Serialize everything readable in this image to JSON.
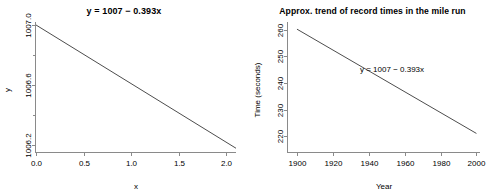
{
  "figure": {
    "background": "#ffffff",
    "line_color": "#4d4d4d",
    "axis_color": "#8a8a8a",
    "panel_count": 2
  },
  "chart_data": [
    {
      "type": "line",
      "panel": "left",
      "title": "y = 1007 − 0.393x",
      "xlabel": "x",
      "ylabel": "y",
      "xlim": [
        0.0,
        2.1
      ],
      "ylim": [
        1006.15,
        1007.02
      ],
      "xticks": [
        0.0,
        0.5,
        1.0,
        1.5,
        2.0
      ],
      "xticklabels": [
        "0.0",
        "0.5",
        "1.0",
        "1.5",
        "2.0"
      ],
      "yticks": [
        1006.2,
        1006.6,
        1007.0
      ],
      "yticklabels": [
        "1006.2",
        "1006.6",
        "1007.0"
      ],
      "yminorticks": [
        1006.4,
        1006.8
      ],
      "grid": false,
      "legend": "none",
      "series": [
        {
          "name": "y = 1007 - 0.393x",
          "slope": -0.393,
          "intercept": 1007,
          "x": [
            0.0,
            2.1
          ],
          "values": [
            1007.0,
            1006.175
          ]
        }
      ]
    },
    {
      "type": "line",
      "panel": "right",
      "title": "Approx. trend of record times in the mile run",
      "xlabel": "Year",
      "ylabel": "Time (seconds)",
      "xlim": [
        1895,
        2002
      ],
      "ylim": [
        214,
        263
      ],
      "xticks": [
        1900,
        1920,
        1940,
        1960,
        1980,
        2000
      ],
      "xticklabels": [
        "1900",
        "1920",
        "1940",
        "1960",
        "1980",
        "2000"
      ],
      "yticks": [
        220,
        230,
        240,
        250,
        260
      ],
      "yticklabels": [
        "220",
        "230",
        "240",
        "250",
        "260"
      ],
      "grid": false,
      "legend": "none",
      "annotation": "y = 1007 − 0.393x",
      "series": [
        {
          "name": "y = 1007 - 0.393x",
          "slope": -0.393,
          "intercept": 1007,
          "x": [
            1900,
            2000
          ],
          "values": [
            260.3,
            221.0
          ]
        }
      ]
    }
  ]
}
